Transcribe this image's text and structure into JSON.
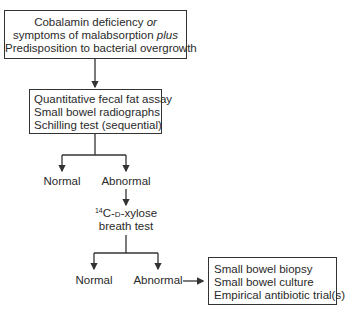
{
  "nodes": {
    "start": {
      "line1_a": "Cobalamin deficiency ",
      "line1_b": "or",
      "line2_a": "symptoms of malabsorption ",
      "line2_b": "plus",
      "line3": "Predisposition to bacterial overgrowth"
    },
    "tests": {
      "lines": [
        "Quantitative fecal fat assay",
        "Small bowel radiographs",
        "Schilling test (sequential)"
      ]
    },
    "result1": {
      "normal": "Normal",
      "abnormal": "Abnormal"
    },
    "xylose": {
      "sup": "14",
      "pre": "C-",
      "d": "d",
      "post": "-xylose",
      "line2": "breath test"
    },
    "result2": {
      "normal": "Normal",
      "abnormal": "Abnormal"
    },
    "final": {
      "lines": [
        "Small bowel biopsy",
        "Small bowel culture",
        "Empirical antibiotic trial(s)"
      ]
    }
  }
}
